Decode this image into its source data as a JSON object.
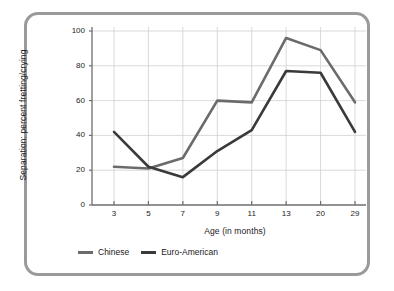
{
  "chart_data": {
    "type": "line",
    "title": "",
    "xlabel": "Age (in months)",
    "ylabel": "Separation: percent fretting/crying",
    "categories": [
      "3",
      "5",
      "7",
      "9",
      "11",
      "13",
      "20",
      "29"
    ],
    "ytick_labels": [
      "0",
      "20",
      "40",
      "60",
      "80",
      "100"
    ],
    "ylim": [
      0,
      100
    ],
    "grid": true,
    "legend_position": "bottom-left",
    "series": [
      {
        "name": "Chinese",
        "color": "#6b6b6b",
        "values": [
          22,
          21,
          27,
          60,
          59,
          96,
          89,
          59
        ]
      },
      {
        "name": "Euro-American",
        "color": "#3a3a3a",
        "values": [
          42,
          22,
          16,
          31,
          43,
          77,
          76,
          42
        ]
      }
    ]
  },
  "frame": {
    "border_color": "#9a9a9a"
  }
}
